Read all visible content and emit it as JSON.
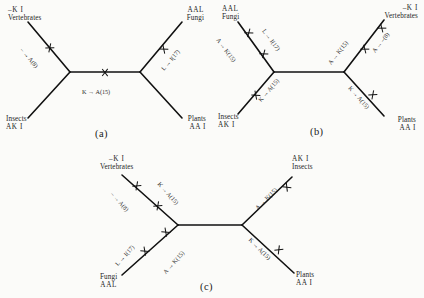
{
  "figure": {
    "type": "phylogenetic-tree-figure",
    "panel_count": 3,
    "glyph": "x-mark",
    "arrow": "→"
  },
  "panels": [
    {
      "id": "a",
      "label": "(a)",
      "taxa": [
        {
          "name": "Vertebrates",
          "seq": "–K I",
          "position": "top-left",
          "seq_first": true
        },
        {
          "name": "Fungi",
          "seq": "AAL",
          "position": "top-right",
          "seq_first": true
        },
        {
          "name": "Insects",
          "seq": "AK I",
          "position": "bottom-left",
          "seq_first": false
        },
        {
          "name": "Plants",
          "seq": "AA I",
          "position": "bottom-right",
          "seq_first": false
        }
      ],
      "mutations": [
        {
          "text": "– → A(8)",
          "branch": "top-left"
        },
        {
          "text": "K → A(15)",
          "branch": "internal"
        },
        {
          "text": "L → I(17)",
          "branch": "top-right"
        }
      ]
    },
    {
      "id": "b",
      "label": "(b)",
      "taxa": [
        {
          "name": "Fungi",
          "seq": "AAL",
          "position": "top-left",
          "seq_first": true
        },
        {
          "name": "Vertebrates",
          "seq": "–K I",
          "position": "top-right",
          "seq_first": true
        },
        {
          "name": "Insects",
          "seq": "AK I",
          "position": "bottom-left",
          "seq_first": false
        },
        {
          "name": "Plants",
          "seq": "AA I",
          "position": "bottom-right",
          "seq_first": false
        }
      ],
      "mutations": [
        {
          "text": "A → K(15)",
          "branch": "top-left-outer"
        },
        {
          "text": "L → I(17)",
          "branch": "top-left-inner"
        },
        {
          "text": "A → K(15)",
          "branch": "top-right-inner"
        },
        {
          "text": "A → –(8)",
          "branch": "top-right-outer"
        },
        {
          "text": "K → A(15)",
          "branch": "bottom-left"
        },
        {
          "text": "K → A(15)",
          "branch": "bottom-right"
        }
      ]
    },
    {
      "id": "c",
      "label": "(c)",
      "taxa": [
        {
          "name": "Vertebrates",
          "seq": "–K I",
          "position": "top-left",
          "seq_first": true
        },
        {
          "name": "Insects",
          "seq": "AK I",
          "position": "top-right",
          "seq_first": true
        },
        {
          "name": "Fungi",
          "seq": "AAL",
          "position": "bottom-left",
          "seq_first": false
        },
        {
          "name": "Plants",
          "seq": "AA I",
          "position": "bottom-right",
          "seq_first": false
        }
      ],
      "mutations": [
        {
          "text": "– → A(8)",
          "branch": "top-left-outer"
        },
        {
          "text": "K → A(15)",
          "branch": "top-left-inner"
        },
        {
          "text": "A → K(15)",
          "branch": "top-right"
        },
        {
          "text": "L → I(17)",
          "branch": "bottom-left-outer"
        },
        {
          "text": "A → K(15)",
          "branch": "bottom-left-inner"
        },
        {
          "text": "K → A(15)",
          "branch": "bottom-right"
        }
      ]
    }
  ],
  "colors": {
    "background": "#fbfbf9",
    "line": "#111111",
    "text": "#1a1a1a"
  }
}
